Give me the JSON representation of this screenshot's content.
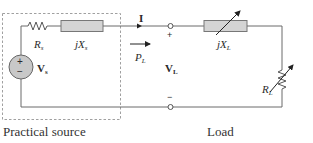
{
  "diagram": {
    "source_box_label": "Practical source",
    "load_label": "Load",
    "components": {
      "source_resistor": {
        "symbol": "R",
        "sub": "s"
      },
      "source_reactance": {
        "prefix": "jX",
        "sub": "s"
      },
      "source_voltage": {
        "symbol": "V",
        "sub": "s",
        "plus": "+",
        "minus": "−"
      },
      "load_reactance": {
        "prefix": "jX",
        "sub": "L",
        "variable": true
      },
      "load_resistor": {
        "symbol": "R",
        "sub": "L",
        "variable": true
      }
    },
    "current": {
      "symbol": "I"
    },
    "power": {
      "symbol": "P",
      "sub": "L"
    },
    "load_voltage": {
      "symbol": "V",
      "sub": "L",
      "plus": "+",
      "minus": "−"
    }
  },
  "colors": {
    "wire": "#6a6a6a",
    "component_fill": "#d4d4d4",
    "source_fill": "#c8c8c8",
    "dashed_box": "#9a9a9a",
    "text": "#2a2a2a"
  }
}
